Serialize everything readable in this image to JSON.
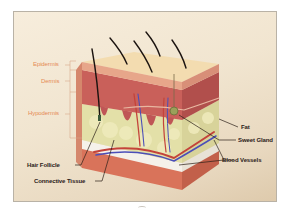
{
  "diagram": {
    "layer_labels": [
      {
        "id": "epidermis",
        "label": "Epidermis"
      },
      {
        "id": "dermis",
        "label": "Dermis"
      },
      {
        "id": "hypodermis",
        "label": "Hypodermis"
      }
    ],
    "structure_labels": [
      {
        "id": "hair-follicle",
        "label": "Hair Follicle"
      },
      {
        "id": "connective-tissue",
        "label": "Connective Tissue"
      },
      {
        "id": "fat",
        "label": "Fat"
      },
      {
        "id": "sweat-gland",
        "label": "Sweet Gland"
      },
      {
        "id": "blood-vessels",
        "label": "Blood Vessels"
      }
    ],
    "colors": {
      "layer_label": "#e58a55",
      "structure_label": "#2b2019",
      "epidermis": "#f3dcb0",
      "dermis": "#c9605a",
      "fat": "#e3e0a8",
      "connective": "#f5f1ea",
      "base": "#d9735a",
      "artery": "#c4433a",
      "vein": "#4c4fb8",
      "hair": "#1c1410"
    }
  }
}
